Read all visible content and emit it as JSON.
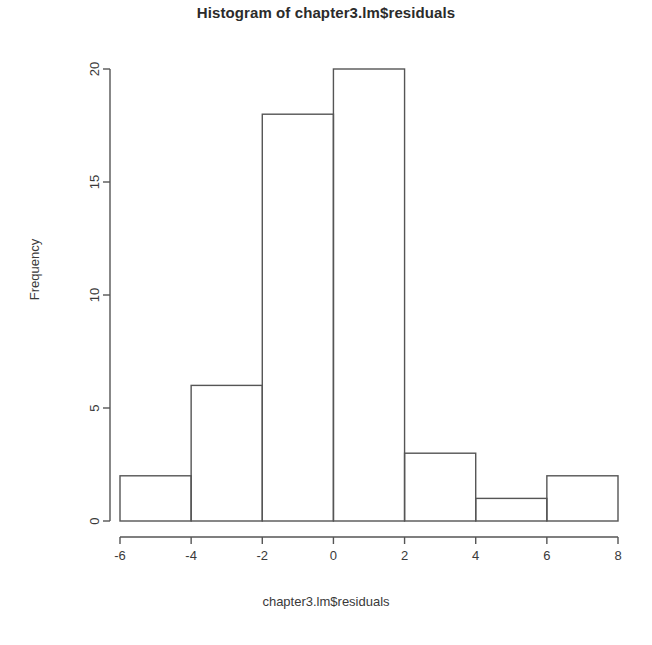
{
  "chart_data": {
    "type": "bar",
    "title": "Histogram of chapter3.lm$residuals",
    "xlabel": "chapter3.lm$residuals",
    "ylabel": "Frequency",
    "categories": [
      "[-6,-4)",
      "[-4,-2)",
      "[-2,0)",
      "[0,2)",
      "[2,4)",
      "[4,6)",
      "[6,8]"
    ],
    "bin_edges": [
      -6,
      -4,
      -2,
      0,
      2,
      4,
      6,
      8
    ],
    "values": [
      2,
      6,
      18,
      20,
      3,
      1,
      2
    ],
    "xlim": [
      -6,
      8
    ],
    "ylim": [
      0,
      20
    ],
    "x_ticks": [
      -6,
      -4,
      -2,
      0,
      2,
      4,
      6,
      8
    ],
    "x_tick_labels": [
      "-6",
      "-4",
      "-2",
      "0",
      "2",
      "4",
      "6",
      "8"
    ],
    "y_ticks": [
      0,
      5,
      10,
      15,
      20
    ],
    "y_tick_labels": [
      "0",
      "5",
      "10",
      "15",
      "20"
    ],
    "grid": false,
    "legend": false,
    "bar_fill": "none",
    "bar_stroke": "#555555",
    "background": "#ffffff",
    "y_tick_label_rotation": -90,
    "total_count": 52
  }
}
